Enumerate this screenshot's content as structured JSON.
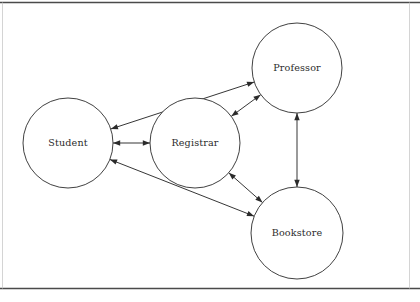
{
  "diagram": {
    "type": "collaboration-diagram",
    "title": "",
    "canvas": {
      "width": 420,
      "height": 302,
      "background": "#ffffff"
    },
    "frame": {
      "top_rule_y": 2.5,
      "bottom_rule_y": 288.5,
      "left_rule_x": 2.5,
      "right_rule_x": 409.5,
      "strong_color": "#4a4a4a",
      "faint_color": "#c9c9c9"
    },
    "style": {
      "node_fill": "#ffffff",
      "node_stroke": "#2b2b2b",
      "edge_stroke": "#2b2b2b",
      "label_color": "#2b2b2b"
    },
    "nodes": [
      {
        "id": "student",
        "label": "Student",
        "cx": 68,
        "cy": 143,
        "r": 45
      },
      {
        "id": "registrar",
        "label": "Registrar",
        "cx": 195,
        "cy": 143,
        "r": 45
      },
      {
        "id": "professor",
        "label": "Professor",
        "cx": 297,
        "cy": 68,
        "r": 45
      },
      {
        "id": "bookstore",
        "label": "Bookstore",
        "cx": 297,
        "cy": 233,
        "r": 46
      }
    ],
    "edges": [
      {
        "id": "student-registrar",
        "from": "student",
        "to": "registrar",
        "arrows": "both",
        "label": ""
      },
      {
        "id": "student-professor",
        "from": "student",
        "to": "professor",
        "arrows": "both",
        "label": ""
      },
      {
        "id": "student-bookstore",
        "from": "student",
        "to": "bookstore",
        "arrows": "both",
        "label": ""
      },
      {
        "id": "registrar-professor",
        "from": "registrar",
        "to": "professor",
        "arrows": "both",
        "label": ""
      },
      {
        "id": "registrar-bookstore",
        "from": "registrar",
        "to": "bookstore",
        "arrows": "both",
        "label": ""
      },
      {
        "id": "professor-bookstore",
        "from": "professor",
        "to": "bookstore",
        "arrows": "both",
        "label": ""
      }
    ]
  }
}
